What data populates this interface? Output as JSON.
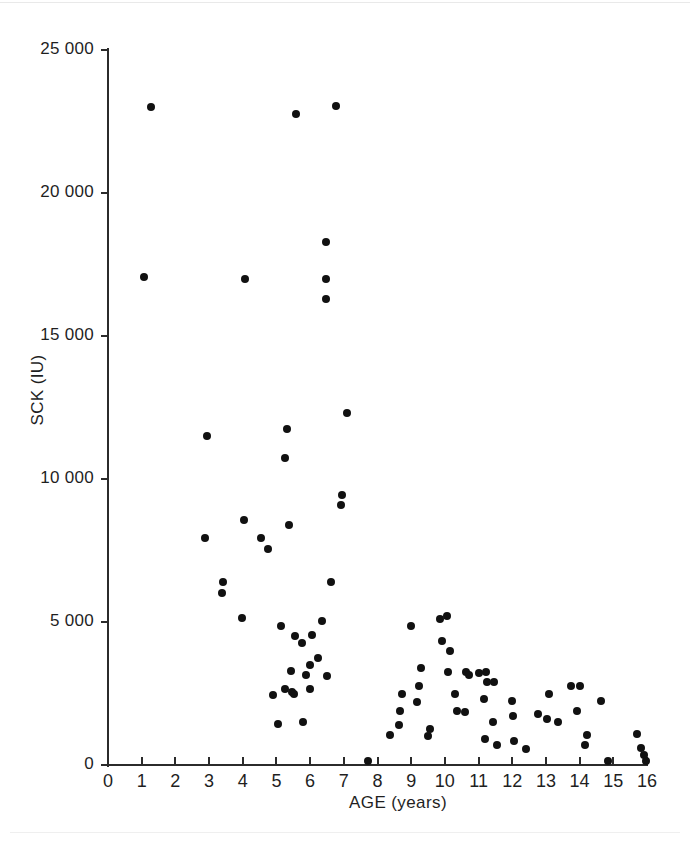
{
  "chart_data": {
    "type": "scatter",
    "title": "",
    "xlabel": "AGE (years)",
    "ylabel": "SCK (IU)",
    "xlim": [
      0,
      16
    ],
    "ylim": [
      0,
      25000
    ],
    "xticks": [
      0,
      1,
      2,
      3,
      4,
      5,
      6,
      7,
      8,
      9,
      10,
      11,
      12,
      13,
      14,
      15,
      16
    ],
    "xtick_labels": [
      "0",
      "1",
      "2",
      "3",
      "4",
      "5",
      "6",
      "7",
      "8",
      "9",
      "10",
      "11",
      "12",
      "13",
      "14",
      "15",
      "16"
    ],
    "yticks": [
      0,
      5000,
      10000,
      15000,
      20000,
      25000
    ],
    "ytick_labels": [
      "0",
      "5 000",
      "10 000",
      "15 000",
      "20 000",
      "25 000"
    ],
    "grid": false,
    "legend": null,
    "marker": {
      "shape": "circle",
      "color": "#111111",
      "size": 8
    },
    "series": [
      {
        "name": "patients",
        "points": [
          [
            1.28,
            23000
          ],
          [
            5.58,
            22750
          ],
          [
            6.77,
            23050
          ],
          [
            6.47,
            18300
          ],
          [
            1.07,
            17050
          ],
          [
            4.07,
            17000
          ],
          [
            6.47,
            17000
          ],
          [
            6.47,
            16300
          ],
          [
            7.1,
            12300
          ],
          [
            2.94,
            11500
          ],
          [
            5.31,
            11750
          ],
          [
            5.25,
            10750
          ],
          [
            6.95,
            9450
          ],
          [
            6.92,
            9100
          ],
          [
            4.04,
            8550
          ],
          [
            5.37,
            8400
          ],
          [
            2.88,
            7950
          ],
          [
            4.54,
            7950
          ],
          [
            4.75,
            7550
          ],
          [
            3.41,
            6400
          ],
          [
            3.38,
            6000
          ],
          [
            6.62,
            6400
          ],
          [
            3.98,
            5150
          ],
          [
            6.35,
            5050
          ],
          [
            5.13,
            4850
          ],
          [
            5.55,
            4500
          ],
          [
            6.07,
            4550
          ],
          [
            5.76,
            4250
          ],
          [
            6.23,
            3750
          ],
          [
            6.01,
            3500
          ],
          [
            5.43,
            3300
          ],
          [
            5.88,
            3150
          ],
          [
            6.5,
            3100
          ],
          [
            5.25,
            2650
          ],
          [
            5.46,
            2550
          ],
          [
            5.52,
            2500
          ],
          [
            6.0,
            2650
          ],
          [
            4.9,
            2450
          ],
          [
            5.79,
            1500
          ],
          [
            5.04,
            1450
          ],
          [
            7.73,
            150
          ],
          [
            8.72,
            2500
          ],
          [
            8.67,
            1900
          ],
          [
            8.63,
            1400
          ],
          [
            8.36,
            1050
          ],
          [
            8.98,
            4850
          ],
          [
            9.28,
            3400
          ],
          [
            9.22,
            2750
          ],
          [
            9.16,
            2200
          ],
          [
            9.55,
            1250
          ],
          [
            9.49,
            1000
          ],
          [
            9.85,
            5100
          ],
          [
            9.91,
            4350
          ],
          [
            10.06,
            5200
          ],
          [
            10.15,
            4000
          ],
          [
            10.09,
            3250
          ],
          [
            10.3,
            2500
          ],
          [
            10.36,
            1900
          ],
          [
            10.63,
            3250
          ],
          [
            10.72,
            3150
          ],
          [
            10.6,
            1850
          ],
          [
            11.02,
            3200
          ],
          [
            11.23,
            3250
          ],
          [
            11.26,
            2900
          ],
          [
            11.17,
            2300
          ],
          [
            11.47,
            2900
          ],
          [
            11.44,
            1500
          ],
          [
            11.2,
            900
          ],
          [
            11.56,
            700
          ],
          [
            12.0,
            2250
          ],
          [
            12.02,
            1700
          ],
          [
            12.05,
            850
          ],
          [
            12.4,
            550
          ],
          [
            12.77,
            1800
          ],
          [
            13.1,
            2500
          ],
          [
            13.02,
            1600
          ],
          [
            13.37,
            1500
          ],
          [
            13.73,
            2750
          ],
          [
            14.0,
            2750
          ],
          [
            13.92,
            1900
          ],
          [
            14.21,
            1050
          ],
          [
            14.15,
            700
          ],
          [
            14.62,
            2250
          ],
          [
            14.83,
            150
          ],
          [
            15.7,
            1100
          ],
          [
            15.82,
            600
          ],
          [
            15.91,
            350
          ],
          [
            15.97,
            150
          ]
        ]
      }
    ]
  }
}
